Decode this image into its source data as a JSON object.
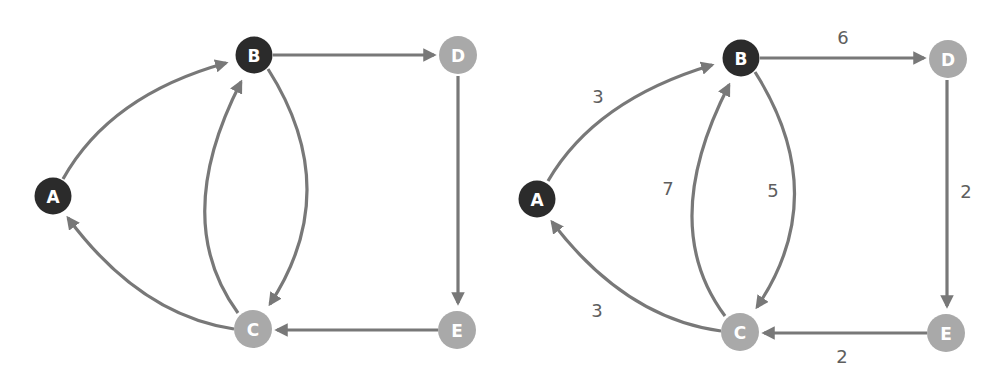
{
  "colors": {
    "dark_node": "#2b2b2b",
    "light_node": "#a9a9a9",
    "edge": "#787878",
    "weight_text": "#5e5e5e"
  },
  "graphs": [
    {
      "name": "unweighted",
      "nodes": [
        {
          "id": "A",
          "label": "A",
          "x": 53,
          "y": 196,
          "style": "dark"
        },
        {
          "id": "B",
          "label": "B",
          "x": 254,
          "y": 55,
          "style": "dark"
        },
        {
          "id": "C",
          "label": "C",
          "x": 253,
          "y": 329,
          "style": "light"
        },
        {
          "id": "D",
          "label": "D",
          "x": 458,
          "y": 55,
          "style": "light"
        },
        {
          "id": "E",
          "label": "E",
          "x": 457,
          "y": 330,
          "style": "light"
        }
      ],
      "edges": [
        {
          "from": "A",
          "to": "B"
        },
        {
          "from": "B",
          "to": "D"
        },
        {
          "from": "B",
          "to": "C"
        },
        {
          "from": "C",
          "to": "B"
        },
        {
          "from": "C",
          "to": "A"
        },
        {
          "from": "D",
          "to": "E"
        },
        {
          "from": "E",
          "to": "C"
        }
      ]
    },
    {
      "name": "weighted",
      "nodes": [
        {
          "id": "A",
          "label": "A",
          "x": 537,
          "y": 199,
          "style": "dark"
        },
        {
          "id": "B",
          "label": "B",
          "x": 741,
          "y": 58,
          "style": "dark"
        },
        {
          "id": "C",
          "label": "C",
          "x": 740,
          "y": 332,
          "style": "light"
        },
        {
          "id": "D",
          "label": "D",
          "x": 948,
          "y": 59,
          "style": "light"
        },
        {
          "id": "E",
          "label": "E",
          "x": 946,
          "y": 333,
          "style": "light"
        }
      ],
      "edges": [
        {
          "from": "A",
          "to": "B",
          "weight": "3"
        },
        {
          "from": "B",
          "to": "D",
          "weight": "6"
        },
        {
          "from": "B",
          "to": "C",
          "weight": "5"
        },
        {
          "from": "C",
          "to": "B",
          "weight": "7"
        },
        {
          "from": "C",
          "to": "A",
          "weight": "3"
        },
        {
          "from": "D",
          "to": "E",
          "weight": "2"
        },
        {
          "from": "E",
          "to": "C",
          "weight": "2"
        }
      ],
      "weight_labels": [
        {
          "edge": "A-B",
          "text": "3",
          "x": 598,
          "y": 96
        },
        {
          "edge": "B-D",
          "text": "6",
          "x": 843,
          "y": 37
        },
        {
          "edge": "C-B",
          "text": "7",
          "x": 668,
          "y": 188
        },
        {
          "edge": "B-C",
          "text": "5",
          "x": 773,
          "y": 190
        },
        {
          "edge": "D-E",
          "text": "2",
          "x": 966,
          "y": 191
        },
        {
          "edge": "C-A",
          "text": "3",
          "x": 597,
          "y": 310
        },
        {
          "edge": "E-C",
          "text": "2",
          "x": 842,
          "y": 356
        }
      ]
    }
  ]
}
